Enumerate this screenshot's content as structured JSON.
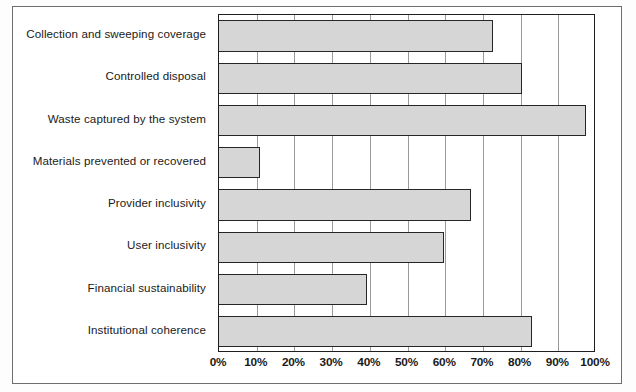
{
  "chart_data": {
    "type": "bar",
    "orientation": "horizontal",
    "title": "",
    "xlabel": "",
    "ylabel": "",
    "xlim": [
      0,
      100
    ],
    "xticks": [
      0,
      10,
      20,
      30,
      40,
      50,
      60,
      70,
      80,
      90,
      100
    ],
    "xtick_labels": [
      "0%",
      "10%",
      "20%",
      "30%",
      "40%",
      "50%",
      "60%",
      "70%",
      "80%",
      "90%",
      "100%"
    ],
    "grid": true,
    "grid_axis": "x",
    "legend": false,
    "categories": [
      "Collection and sweeping coverage",
      "Controlled disposal",
      "Waste captured by the system",
      "Materials prevented or recovered",
      "Provider inclusivity",
      "User inclusivity",
      "Financial sustainability",
      "Institutional coherence"
    ],
    "values": [
      72.7,
      80.4,
      97.3,
      11.0,
      66.8,
      59.7,
      39.3,
      83.0
    ],
    "value_unit": "percent",
    "bar_fill_color": "#d6d6d6",
    "bar_edge_color": "#262626",
    "gridline_color": "#9a9a9a",
    "axis_color": "#1e1e1e",
    "background_color": "#ffffff"
  },
  "figure": {
    "frame_color": "#6e6e6e",
    "page_background": "#fdfdfd"
  }
}
